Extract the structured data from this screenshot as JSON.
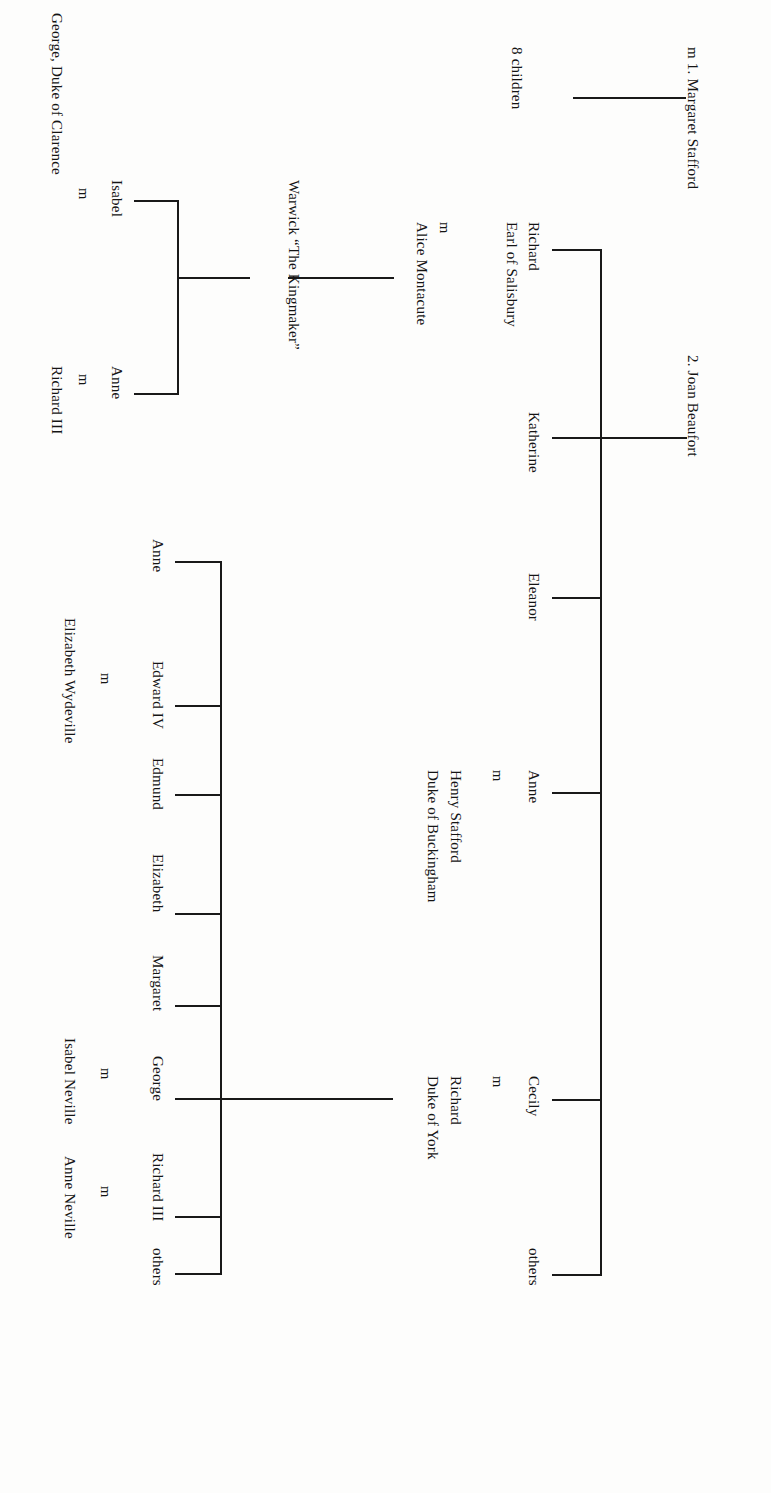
{
  "document": {
    "kind": "genealogical-family-tree",
    "orientation": "rotated-90-clockwise",
    "title": "Neville and York family tree"
  },
  "nodes": {
    "marriage_1": "m 1. Margaret Stafford",
    "children_1": "8 children",
    "marriage_2": "2. Joan Beaufort",
    "joan_children": {
      "richard": "Richard",
      "richard_title": "Earl of Salisbury",
      "katherine": "Katherine",
      "eleanor": "Eleanor",
      "anne": "Anne",
      "cecily": "Cecily",
      "others": "others"
    },
    "salisbury_marriage_mark": "m",
    "alice": "Alice Montacute",
    "warwick": "Warwick “The Kingmaker”",
    "warwick_children": {
      "isabel": "Isabel",
      "anne": "Anne"
    },
    "isabel_marriage_mark": "m",
    "anne_marriage_mark": "m",
    "george_clarence": "George, Duke of Clarence",
    "richard_iii_spouse": "Richard III",
    "anne_neville_marriage_mark": "m",
    "henry_stafford": "Henry Stafford",
    "buckingham_title": "Duke of Buckingham",
    "cecily_marriage_mark": "m",
    "richard_york": "Richard",
    "york_title": "Duke of York",
    "york_children": {
      "anne": "Anne",
      "edward_iv": "Edward IV",
      "edmund": "Edmund",
      "elizabeth": "Elizabeth",
      "margaret": "Margaret",
      "george": "George",
      "richard_iii": "Richard III",
      "others": "others"
    },
    "edward_marriage_mark": "m",
    "elizabeth_wydeville": "Elizabeth Wydeville",
    "george_marriage_mark": "m",
    "isabel_neville": "Isabel Neville",
    "richard_marriage_mark": "m",
    "anne_neville": "Anne Neville"
  },
  "style": {
    "ink": "#191919",
    "paper": "#fdfdfc"
  }
}
